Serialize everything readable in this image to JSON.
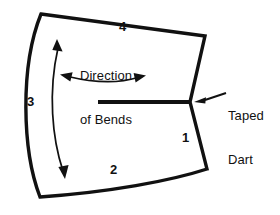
{
  "figure": {
    "type": "technical-line-drawing",
    "stroke_color": "#111111",
    "background_color": "#ffffff"
  },
  "labels": {
    "edge_1": "1",
    "edge_2": "2",
    "edge_3": "3",
    "edge_4": "4"
  },
  "annotations": {
    "direction_line1": "Direction",
    "direction_line2": "of Bends",
    "taped_dart_line1": "Taped",
    "taped_dart_line2": "Dart"
  },
  "icons": {
    "bend_arrow_vertical": "double-headed-curved-arrow-vertical",
    "bend_arrow_horizontal": "double-headed-curved-arrow-horizontal",
    "leader_arrow": "leader-arrow-icon",
    "dart_slit": "dart-slit-line"
  }
}
